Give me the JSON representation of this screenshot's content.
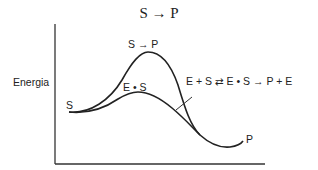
{
  "title": "S → P",
  "axes": {
    "ylabel": "Energia",
    "xlabel": ""
  },
  "labels": {
    "start": "S",
    "end": "P",
    "uncatalyzed_peak": "S → P",
    "catalyzed_peak": "E • S",
    "catalyzed_reaction": "E + S ⇄ E • S → P + E"
  },
  "curves": [
    {
      "name": "uncatalyzed",
      "description": "Higher energy barrier S → P"
    },
    {
      "name": "catalyzed",
      "description": "Lower energy barrier via E • S complex"
    }
  ]
}
